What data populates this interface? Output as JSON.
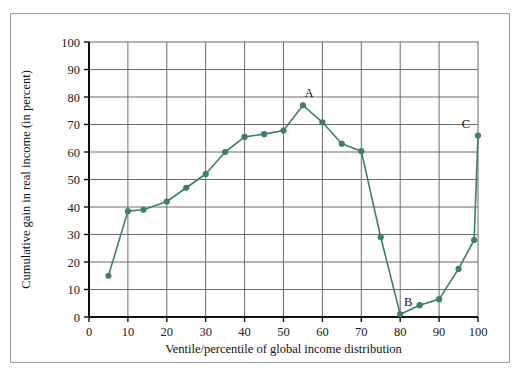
{
  "chart_data": {
    "type": "line",
    "title": "",
    "xlabel": "Ventile/percentile of global income distribution",
    "ylabel": "Cumulative gain in real income (in percent)",
    "xlim": [
      0,
      100
    ],
    "ylim": [
      0,
      100
    ],
    "xticks": [
      0,
      10,
      20,
      30,
      40,
      50,
      60,
      70,
      80,
      90,
      100
    ],
    "xtick_labels": [
      "0",
      "10",
      "20",
      "30",
      "40",
      "50",
      "60",
      "70",
      "80",
      "90",
      "100"
    ],
    "yticks": [
      0,
      10,
      20,
      30,
      40,
      50,
      60,
      70,
      80,
      90,
      100
    ],
    "ytick_labels": [
      "0",
      "10",
      "20",
      "30",
      "40",
      "50",
      "60",
      "70",
      "80",
      "90",
      "100"
    ],
    "grid": true,
    "grid_x": true,
    "grid_y": true,
    "legend": false,
    "legend_position": "none",
    "series": [
      {
        "name": "Cumulative gain in real income",
        "color": "#3d7d72",
        "marker": "circle",
        "x": [
          5,
          10,
          14,
          20,
          25,
          30,
          35,
          40,
          45,
          50,
          55,
          60,
          65,
          70,
          75,
          80,
          85,
          90,
          95,
          99,
          100
        ],
        "values": [
          15.0,
          38.5,
          39.0,
          42.0,
          47.0,
          52.0,
          60.0,
          65.5,
          66.5,
          67.8,
          77.0,
          70.8,
          63.0,
          60.3,
          29.0,
          1.0,
          4.3,
          6.5,
          17.5,
          28.0,
          66.0
        ]
      }
    ],
    "annotations": [
      {
        "text": "A",
        "x": 55,
        "y": 77.0,
        "dx": 6,
        "dy": -8
      },
      {
        "text": "B",
        "x": 80,
        "y": 1.0,
        "dx": 8,
        "dy": -8
      },
      {
        "text": "C",
        "x": 100,
        "y": 66.0,
        "dx": -12,
        "dy": -8
      }
    ]
  },
  "colors": {
    "line": "#3d7d72",
    "marker": "#3d7d72",
    "grid": "#6b6b6b",
    "axis": "#111111",
    "frame": "#9a9a9a",
    "background": "#ffffff"
  }
}
